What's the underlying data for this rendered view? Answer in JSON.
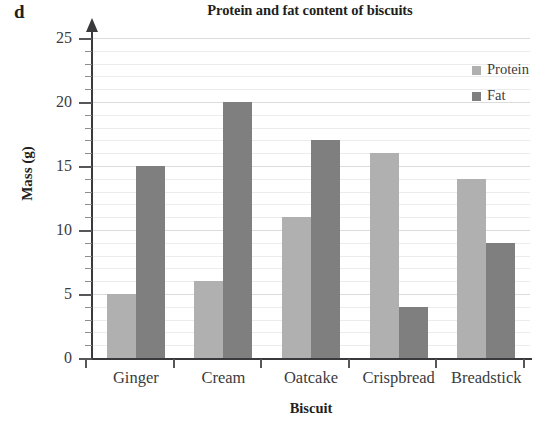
{
  "panel_letter": "d",
  "axis": {
    "y_title": "Mass (g)",
    "x_title": "Biscuit",
    "y_tick_labels": [
      "0",
      "5",
      "10",
      "15",
      "20",
      "25"
    ]
  },
  "legend": {
    "items": [
      {
        "label": "Protein",
        "color": "#b0b0b0",
        "swatch_name": "legend-swatch-protein"
      },
      {
        "label": "Fat",
        "color": "#7f7f7f",
        "swatch_name": "legend-swatch-fat"
      }
    ]
  },
  "chart_data": {
    "type": "bar",
    "title": "Protein and fat content of biscuits",
    "xlabel": "Biscuit",
    "ylabel": "Mass (g)",
    "ylim": [
      0,
      25
    ],
    "ytick_step": 5,
    "yminor_step": 1,
    "grid": true,
    "grid_axis": "y",
    "legend_position": "top-right",
    "categories": [
      "Ginger",
      "Cream",
      "Oatcake",
      "Crispbread",
      "Breadstick"
    ],
    "series": [
      {
        "name": "Protein",
        "color": "#b0b0b0",
        "values": [
          5,
          6,
          11,
          16,
          14
        ]
      },
      {
        "name": "Fat",
        "color": "#7f7f7f",
        "values": [
          15,
          20,
          17,
          4,
          9
        ]
      }
    ]
  }
}
